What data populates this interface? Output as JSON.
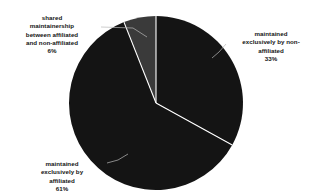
{
  "chart_data": {
    "type": "pie",
    "title": "",
    "subtitle": "",
    "xlabel": "",
    "ylabel": "",
    "legend_position": "none",
    "grid": false,
    "labels_inline": true,
    "categories": [
      "maintained exclusively by non-affiliated",
      "maintained exclusively by affiliated",
      "shared maintainership between affiliated and non-affiliated"
    ],
    "values": [
      33,
      61,
      6
    ],
    "value_unit": "%",
    "colors": [
      "#141414",
      "#141414",
      "#3a3a3a"
    ],
    "start_angle_deg": 0,
    "direction": "clockwise",
    "slices": [
      {
        "label": "maintained exclusively by non-affiliated",
        "value": 33,
        "display": "33%",
        "color": "#141414"
      },
      {
        "label": "maintained exclusively by affiliated",
        "value": 61,
        "display": "61%",
        "color": "#141414"
      },
      {
        "label": "shared maintainership between affiliated and non-affiliated",
        "value": 6,
        "display": "6%",
        "color": "#3a3a3a"
      }
    ]
  },
  "labels": {
    "shared": {
      "text": "shared\nmaintainership\nbetween affiliated\nand non-affiliated",
      "percent": "6%"
    },
    "non_affiliated": {
      "text": "maintained\nexclusively by non-\naffiliated",
      "percent": "33%"
    },
    "affiliated": {
      "text": "maintained\nexclusively by\naffiliated",
      "percent": "61%"
    }
  },
  "style": {
    "background": "#ffffff",
    "slice_dark": "#141414",
    "slice_gray": "#3a3a3a",
    "separator": "#ffffff",
    "leader_line": "#b9b9b9",
    "text_color": "#141414"
  }
}
